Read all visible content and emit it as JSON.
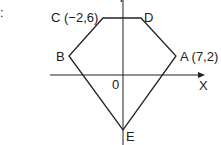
{
  "diagram": {
    "type": "coordinate-geometry-pentagon",
    "marker": ":",
    "axes": {
      "x_label": "X",
      "y_label": "Y",
      "origin_label": "0"
    },
    "points": [
      {
        "name": "A",
        "label": "A (7,2)",
        "coords": [
          7,
          2
        ]
      },
      {
        "name": "B",
        "label": "B"
      },
      {
        "name": "C",
        "label": "C (−2,6)",
        "coords": [
          -2,
          6
        ]
      },
      {
        "name": "D",
        "label": "D"
      },
      {
        "name": "E",
        "label": "E"
      }
    ],
    "polygon_order": [
      "C",
      "D",
      "A",
      "E",
      "B"
    ],
    "colors": {
      "line": "#222222",
      "background": "#ffffff"
    }
  }
}
